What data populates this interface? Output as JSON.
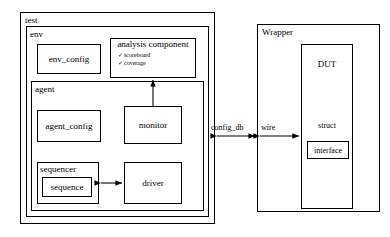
{
  "diagram": {
    "line_color": "#000000",
    "background": "#ffffff"
  },
  "containers": {
    "test": {
      "label": "test"
    },
    "env": {
      "label": "env"
    },
    "agent": {
      "label": "agent"
    },
    "wrapper": {
      "label": "Wrapper"
    }
  },
  "blocks": {
    "env_config": {
      "label": "env_config"
    },
    "analysis_component": {
      "label": "analysis component",
      "items": [
        {
          "bullet": "check-icon",
          "label": "scoreboard"
        },
        {
          "bullet": "check-icon",
          "label": "coverage"
        }
      ]
    },
    "agent_config": {
      "label": "agent_config"
    },
    "monitor": {
      "label": "monitor"
    },
    "sequencer": {
      "label": "sequencer"
    },
    "sequence": {
      "label": "sequence"
    },
    "driver": {
      "label": "driver"
    },
    "dut": {
      "label": "DUT"
    },
    "struct": {
      "label": "struct"
    },
    "interface": {
      "label": "interface"
    }
  },
  "connectors": {
    "config_db": {
      "label": "config_db",
      "style": "double-arrow"
    },
    "wire": {
      "label": "wire",
      "style": "double-arrow"
    },
    "monitor_to_analysis": {
      "label": "",
      "style": "single-arrow-up"
    },
    "sequencer_to_driver": {
      "label": "",
      "style": "double-arrow"
    }
  }
}
